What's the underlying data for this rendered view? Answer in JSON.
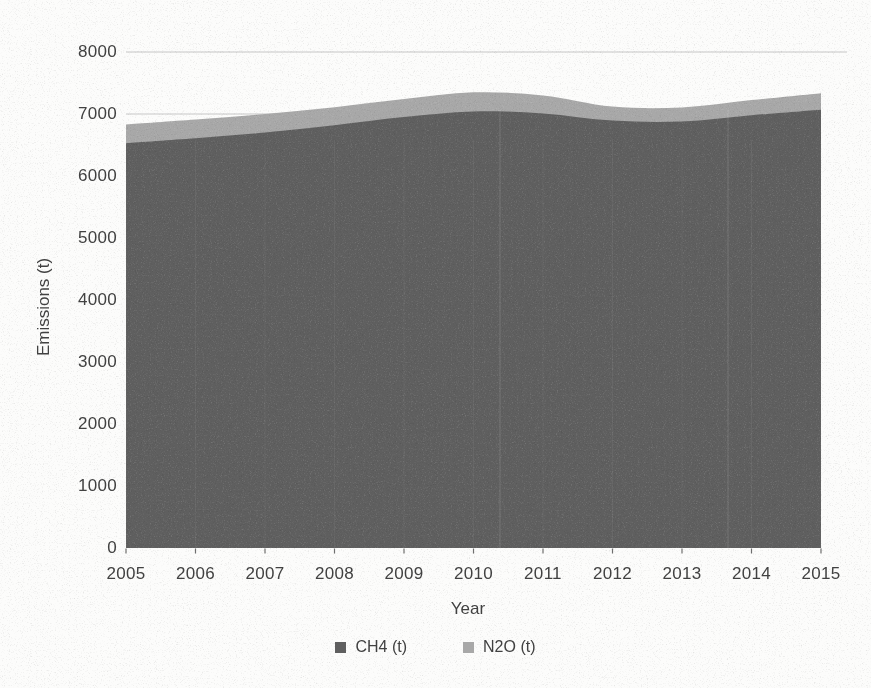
{
  "chart_data": {
    "type": "area",
    "stacked": true,
    "x": [
      2005,
      2006,
      2007,
      2008,
      2009,
      2010,
      2011,
      2012,
      2013,
      2014,
      2015
    ],
    "series": [
      {
        "name": "CH4 (t)",
        "color": "#5f5f5f",
        "values": [
          6530,
          6610,
          6700,
          6820,
          6950,
          7040,
          7010,
          6895,
          6880,
          6980,
          7070
        ]
      },
      {
        "name": "N2O (t)",
        "color": "#a8a8a8",
        "values": [
          300,
          300,
          300,
          290,
          290,
          310,
          290,
          225,
          225,
          245,
          265
        ]
      }
    ],
    "xlabel": "Year",
    "ylabel": "Emissions (t)",
    "ylim": [
      0,
      8000
    ],
    "ytick_step": 1000,
    "yticks": [
      0,
      1000,
      2000,
      3000,
      4000,
      5000,
      6000,
      7000,
      8000
    ],
    "grid": "horizontal",
    "gridline_color": "#c6c6c6",
    "text_color": "#414141",
    "legend_position": "bottom"
  }
}
